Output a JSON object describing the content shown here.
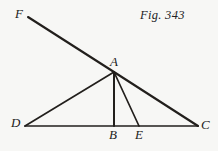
{
  "figure": {
    "caption": "Fig. 343",
    "background_color": "#f7f7f5",
    "ink_color": "#221f1c",
    "width": 218,
    "height": 151
  },
  "points": {
    "F": {
      "label": "F",
      "x": 28,
      "y": 17
    },
    "A": {
      "label": "A",
      "x": 114,
      "y": 72
    },
    "D": {
      "label": "D",
      "x": 25,
      "y": 126
    },
    "B": {
      "label": "B",
      "x": 114,
      "y": 126
    },
    "E": {
      "label": "E",
      "x": 139,
      "y": 126
    },
    "C": {
      "label": "C",
      "x": 198,
      "y": 126
    }
  },
  "segments": [
    {
      "name": "line-FC",
      "from": "F",
      "to": "C",
      "via": "A",
      "width": 2.1
    },
    {
      "name": "line-DC",
      "from": "D",
      "to": "C",
      "width": 1.7
    },
    {
      "name": "line-DA",
      "from": "D",
      "to": "A",
      "width": 1.7
    },
    {
      "name": "line-AB",
      "from": "A",
      "to": "B",
      "width": 2.0
    },
    {
      "name": "line-AE",
      "from": "A",
      "to": "E",
      "width": 1.7
    }
  ],
  "chart_data": {
    "type": "diagram",
    "title": "Fig. 343",
    "subtitle": "",
    "xlabel": "",
    "ylabel": "",
    "xlim": [
      0,
      218
    ],
    "ylim": [
      151,
      0
    ],
    "grid": false,
    "legend": "none",
    "vertices": [
      {
        "label": "F",
        "x": 28,
        "y": 17
      },
      {
        "label": "A",
        "x": 114,
        "y": 72
      },
      {
        "label": "D",
        "x": 25,
        "y": 126
      },
      {
        "label": "B",
        "x": 114,
        "y": 126
      },
      {
        "label": "E",
        "x": 139,
        "y": 126
      },
      {
        "label": "C",
        "x": 198,
        "y": 126
      }
    ],
    "edges": [
      [
        "F",
        "A"
      ],
      [
        "A",
        "C"
      ],
      [
        "D",
        "C"
      ],
      [
        "D",
        "A"
      ],
      [
        "A",
        "B"
      ],
      [
        "A",
        "E"
      ]
    ],
    "annotations": [
      "Fig. 343"
    ]
  }
}
